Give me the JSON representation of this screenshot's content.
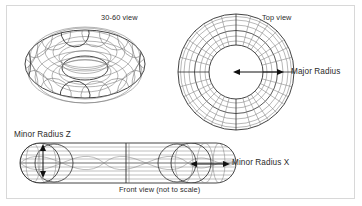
{
  "figure": {
    "background_color": "#ffffff",
    "border_color": "#d8d8d8",
    "ink_color": "#2b2b2b",
    "wire_color": "#7a7a7a"
  },
  "labels": {
    "view_3060": "30-60 view",
    "view_top": "Top view",
    "major_radius": "Major Radius",
    "minor_radius_z": "Minor Radius Z",
    "minor_radius_x": "Minor Radius X",
    "view_front": "Front view (not to scale)"
  },
  "panels": [
    {
      "id": "perspective",
      "label": "30-60 view",
      "shape": "wireframe-torus-perspective",
      "center": [
        85,
        64
      ],
      "major_radius_px": 60,
      "minor_radius_px": 24,
      "tilt_degrees": 60,
      "meridians": 20,
      "parallels": 12
    },
    {
      "id": "top",
      "label": "Top view",
      "shape": "wireframe-torus-plan",
      "center": [
        236,
        72
      ],
      "outer_radius_px": 58,
      "inner_radius_px": 27,
      "rings": 7,
      "spokes": 16,
      "dimension_arrow": {
        "label": "Major Radius",
        "from": [
          236,
          72
        ],
        "to": [
          281,
          72
        ],
        "heads": "both"
      }
    },
    {
      "id": "front",
      "label": "Front view (not to scale)",
      "shape": "wireframe-torus-elevation",
      "bounds": [
        20,
        143,
        216,
        40
      ],
      "capsule_radius_px": 20,
      "circles": 4,
      "dimension_arrows": [
        {
          "label": "Minor Radius Z",
          "from": [
            43,
            147
          ],
          "to": [
            43,
            176
          ],
          "heads": "both",
          "orientation": "vertical"
        },
        {
          "label": "Minor Radius X",
          "from": [
            191,
            164
          ],
          "to": [
            228,
            164
          ],
          "heads": "both",
          "orientation": "horizontal"
        }
      ]
    }
  ]
}
